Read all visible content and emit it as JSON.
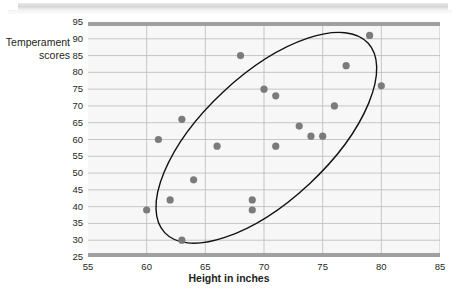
{
  "chart_data": {
    "type": "scatter",
    "title": "",
    "xlabel": "Height in inches",
    "ylabel": "Temperament scores",
    "xlim": [
      55,
      85
    ],
    "ylim": [
      25,
      95
    ],
    "xticks": [
      55,
      60,
      65,
      70,
      75,
      80,
      85
    ],
    "yticks": [
      25,
      30,
      35,
      40,
      45,
      50,
      55,
      60,
      65,
      70,
      75,
      80,
      85,
      90,
      95
    ],
    "grid": "horizontal-and-vertical",
    "legend": "none",
    "point_color": "#7b7b7b",
    "annotation": "ellipse drawn around the cluster of points indicating a positive linear association",
    "points": [
      {
        "x": 60,
        "y": 39
      },
      {
        "x": 61,
        "y": 60
      },
      {
        "x": 62,
        "y": 42
      },
      {
        "x": 63,
        "y": 30
      },
      {
        "x": 63,
        "y": 66
      },
      {
        "x": 64,
        "y": 48
      },
      {
        "x": 66,
        "y": 58
      },
      {
        "x": 68,
        "y": 85
      },
      {
        "x": 69,
        "y": 42
      },
      {
        "x": 69,
        "y": 39
      },
      {
        "x": 70,
        "y": 75
      },
      {
        "x": 71,
        "y": 73
      },
      {
        "x": 71,
        "y": 58
      },
      {
        "x": 73,
        "y": 64
      },
      {
        "x": 74,
        "y": 61
      },
      {
        "x": 75,
        "y": 61
      },
      {
        "x": 76,
        "y": 70
      },
      {
        "x": 77,
        "y": 82
      },
      {
        "x": 79,
        "y": 91
      },
      {
        "x": 80,
        "y": 76
      }
    ]
  },
  "axes": {
    "y_title_line1": "Temperament",
    "y_title_line2": "scores",
    "x_title": "Height in inches"
  }
}
